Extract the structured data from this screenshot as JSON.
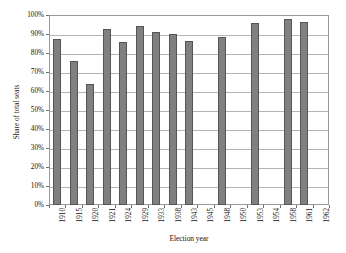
{
  "chart_data": {
    "type": "bar",
    "title": "",
    "xlabel": "Election year",
    "ylabel": "Share of total seats",
    "ylim": [
      0,
      100
    ],
    "ytick_labels": [
      "0%",
      "10%",
      "20%",
      "30%",
      "40%",
      "50%",
      "60%",
      "70%",
      "80%",
      "90%",
      "100%"
    ],
    "ytick_values": [
      0,
      10,
      20,
      30,
      40,
      50,
      60,
      70,
      80,
      90,
      100
    ],
    "grid": true,
    "legend": "none",
    "categories": [
      "1910",
      "1915",
      "1920",
      "1921",
      "1924",
      "1929",
      "1933",
      "1938",
      "1943",
      "1945",
      "1948",
      "1950",
      "1953",
      "1954",
      "1958",
      "1961",
      "1962"
    ],
    "values": [
      87.5,
      76,
      63.5,
      92.5,
      86,
      94,
      91,
      90,
      86.5,
      null,
      88.5,
      null,
      96,
      null,
      98,
      96.5,
      null
    ],
    "bar_color": "#808080",
    "bar_border_color": "#555555",
    "gridline_color": "#b4b4b4",
    "frame_color": "#9a9a9a"
  }
}
